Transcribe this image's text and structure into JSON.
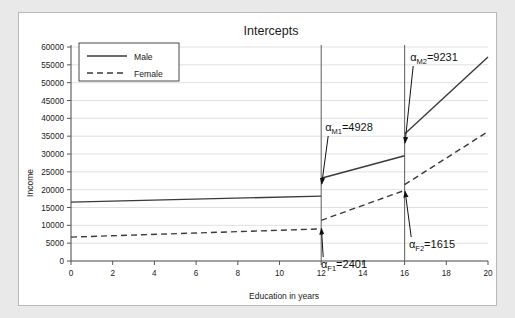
{
  "chart_data": {
    "type": "line",
    "title": "Intercepts",
    "xlabel": "Education in years",
    "ylabel": "Income",
    "xlim": [
      0,
      20
    ],
    "ylim": [
      0,
      60000
    ],
    "xticks": [
      0,
      2,
      4,
      6,
      8,
      10,
      12,
      14,
      16,
      18,
      20
    ],
    "xtick_labels": [
      "0",
      "2",
      "4",
      "6",
      "8",
      "10",
      "12",
      "14",
      "16",
      "18",
      "20"
    ],
    "yticks": [
      0,
      5000,
      10000,
      15000,
      20000,
      25000,
      30000,
      35000,
      40000,
      45000,
      50000,
      55000,
      60000
    ],
    "ytick_labels": [
      "0",
      "5000",
      "10000",
      "15000",
      "20000",
      "25000",
      "30000",
      "35000",
      "40000",
      "45000",
      "50000",
      "55000",
      "60000"
    ],
    "grid": true,
    "legend_position": "top-left",
    "series": [
      {
        "name": "Male",
        "style": "solid",
        "color": "#3a3a3a",
        "segments": [
          [
            {
              "x": 0,
              "y": 16500
            },
            {
              "x": 12,
              "y": 18200
            }
          ],
          [
            {
              "x": 12,
              "y": 23200
            },
            {
              "x": 16,
              "y": 29500
            }
          ],
          [
            {
              "x": 16,
              "y": 35600
            },
            {
              "x": 20,
              "y": 57200
            }
          ]
        ]
      },
      {
        "name": "Female",
        "style": "dashed",
        "color": "#3a3a3a",
        "segments": [
          [
            {
              "x": 0,
              "y": 6700
            },
            {
              "x": 12,
              "y": 9000
            }
          ],
          [
            {
              "x": 12,
              "y": 11400
            },
            {
              "x": 16,
              "y": 19800
            }
          ],
          [
            {
              "x": 16,
              "y": 21400
            },
            {
              "x": 20,
              "y": 36300
            }
          ]
        ]
      }
    ],
    "vertical_lines": [
      {
        "x": 12,
        "color": "#6b6b6b"
      },
      {
        "x": 16,
        "color": "#6b6b6b"
      }
    ],
    "annotations": [
      {
        "id": "alpha-m1",
        "symbol": "α",
        "subscript": "M1",
        "equals": "=",
        "value": "4928",
        "text": "αM1=4928",
        "label_x": 330,
        "label_y": 118,
        "target_x": 12,
        "target_y": 20500
      },
      {
        "id": "alpha-m2",
        "symbol": "α",
        "subscript": "M2",
        "equals": "=",
        "value": "9231",
        "text": "αM2=9231",
        "label_x": 415,
        "label_y": 48,
        "target_x": 16,
        "target_y": 32000
      },
      {
        "id": "alpha-f1",
        "symbol": "α",
        "subscript": "F1",
        "equals": "=",
        "value": "2401",
        "text": "αF1=2401",
        "label_x": 325,
        "label_y": 255,
        "target_x": 12,
        "target_y": 10200
      },
      {
        "id": "alpha-f2",
        "symbol": "α",
        "subscript": "F2",
        "equals": "=",
        "value": "1615",
        "text": "αF2=1615",
        "label_x": 413,
        "label_y": 235,
        "target_x": 16,
        "target_y": 20600
      }
    ],
    "legend": [
      {
        "label": "Male",
        "style": "solid"
      },
      {
        "label": "Female",
        "style": "dashed"
      }
    ]
  },
  "colors": {
    "background": "#e9e9e9",
    "figure": "#ffffff",
    "line": "#3a3a3a",
    "grid": "#d8d8d8",
    "axis": "#555555",
    "annotation": "#111111"
  }
}
